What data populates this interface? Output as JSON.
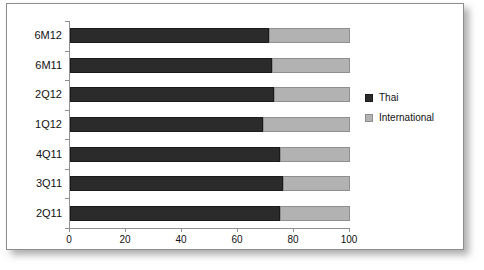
{
  "chart_data": {
    "type": "bar",
    "orientation": "horizontal",
    "stacked": true,
    "title": "",
    "xlabel": "",
    "ylabel": "",
    "xlim": [
      0,
      100
    ],
    "xticks": [
      0,
      20,
      40,
      60,
      80,
      100
    ],
    "grid": false,
    "legend_position": "right",
    "categories": [
      "6M12",
      "6M11",
      "2Q12",
      "1Q12",
      "4Q11",
      "3Q11",
      "2Q11"
    ],
    "series": [
      {
        "name": "Thai",
        "color": "#2b2b2b",
        "values": [
          71,
          72,
          73,
          69,
          75,
          76,
          75
        ]
      },
      {
        "name": "International",
        "color": "#b2b2b2",
        "values": [
          29,
          28,
          27,
          31,
          25,
          24,
          25
        ]
      }
    ]
  },
  "axis": {
    "tick_labels": [
      "0",
      "20",
      "40",
      "60",
      "80",
      "100"
    ]
  },
  "legend": {
    "items": [
      {
        "label": "Thai",
        "swatch": "thai"
      },
      {
        "label": "International",
        "swatch": "intl"
      }
    ]
  }
}
